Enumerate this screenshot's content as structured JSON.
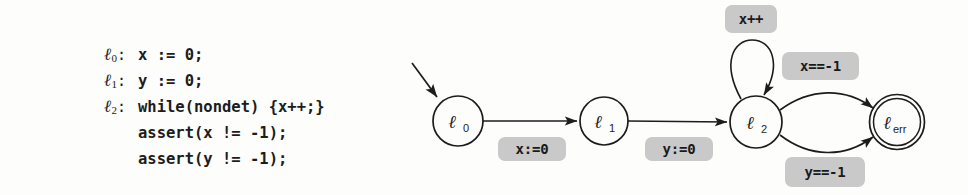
{
  "figure": {
    "kind": "program-with-control-flow-automaton"
  },
  "code": {
    "lines": [
      {
        "label": "ℓ",
        "sub": "0",
        "text": "x := 0;"
      },
      {
        "label": "ℓ",
        "sub": "1",
        "text": "y := 0;"
      },
      {
        "label": "ℓ",
        "sub": "2",
        "text": "while(nondet) {x++;}"
      },
      {
        "label": "",
        "sub": "",
        "text": "assert(x != -1);"
      },
      {
        "label": "",
        "sub": "",
        "text": "assert(y != -1);"
      }
    ]
  },
  "automaton": {
    "nodes": [
      {
        "id": "l0",
        "base": "ℓ",
        "sub": "0",
        "cx": 58,
        "cy": 121,
        "r": 25,
        "accepting": false
      },
      {
        "id": "l1",
        "base": "ℓ",
        "sub": "1",
        "cx": 204,
        "cy": 121,
        "r": 24,
        "accepting": false
      },
      {
        "id": "l2",
        "base": "ℓ",
        "sub": "2",
        "cx": 356,
        "cy": 122,
        "r": 26,
        "accepting": false
      },
      {
        "id": "lerr",
        "base": "ℓ",
        "sub": "err",
        "cx": 497,
        "cy": 122,
        "r": 27,
        "accepting": true
      }
    ],
    "edge_labels": [
      {
        "id": "x-assign-0",
        "text": "x:=0",
        "left": 98,
        "top": 137,
        "width": 68,
        "height": 24
      },
      {
        "id": "y-assign-0",
        "text": "y:=0",
        "left": 245,
        "top": 137,
        "width": 68,
        "height": 24
      },
      {
        "id": "x-incr",
        "text": "x++",
        "left": 325,
        "top": 5,
        "width": 52,
        "height": 28
      },
      {
        "id": "x-eq-neg1",
        "text": "x==-1",
        "left": 382,
        "top": 52,
        "width": 77,
        "height": 28
      },
      {
        "id": "y-eq-neg1",
        "text": "y==-1",
        "left": 385,
        "top": 157,
        "width": 80,
        "height": 30
      }
    ],
    "colors": {
      "stroke": "#1c1c1c",
      "label_background": "#c9c9c9",
      "page_background": "#fdfdfc"
    }
  }
}
